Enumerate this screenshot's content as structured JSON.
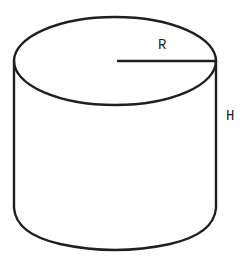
{
  "diagram": {
    "type": "cylinder",
    "labels": {
      "radius": "R",
      "height": "H"
    },
    "colors": {
      "stroke": "#1f1f1f",
      "background": "#ffffff",
      "text": "#222222"
    }
  }
}
